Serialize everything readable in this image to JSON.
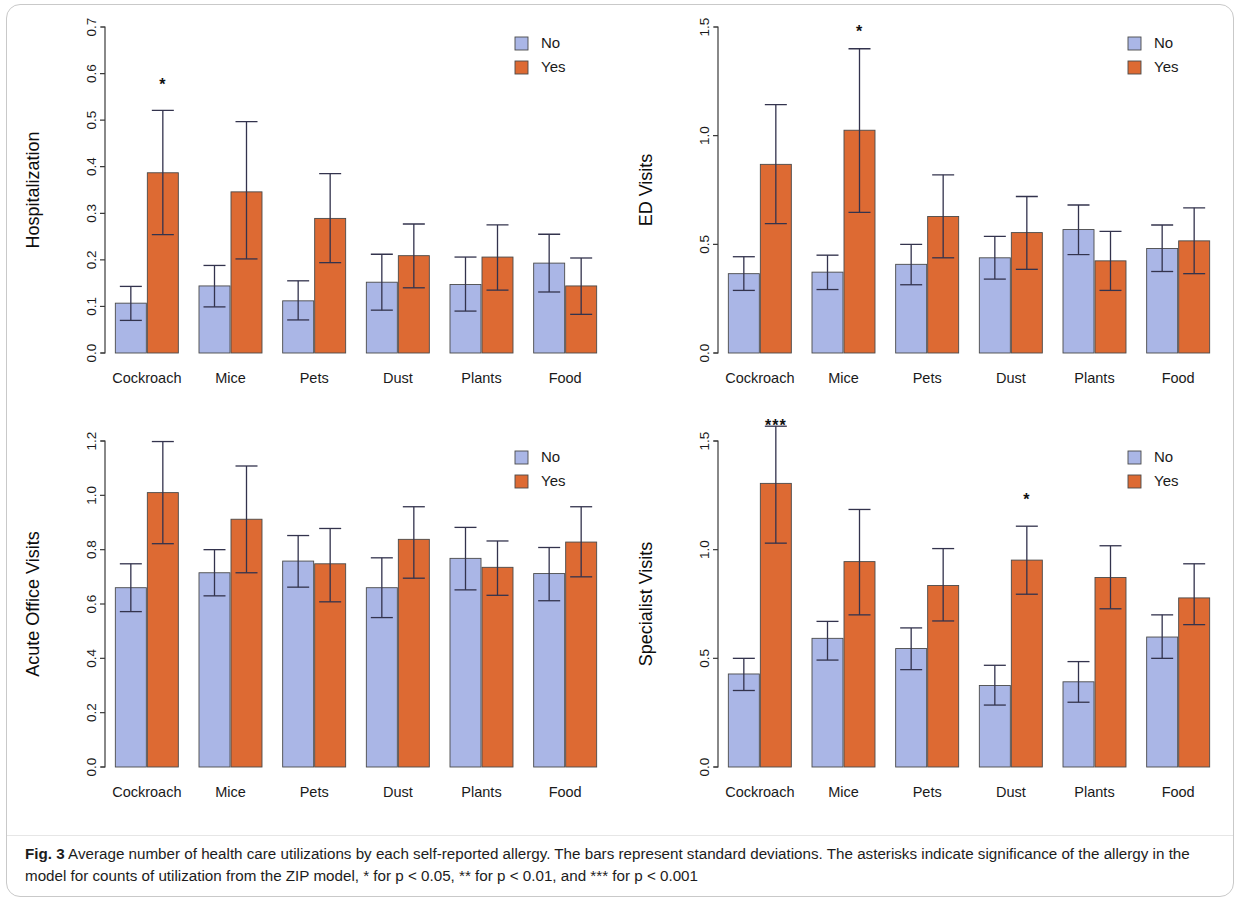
{
  "figure": {
    "label": "Fig. 3",
    "caption": "Average number of health care utilizations by each self-reported allergy. The bars represent standard deviations. The asterisks indicate significance of the allergy in the model for counts of utilization from the ZIP model, * for p < 0.05, ** for p < 0.01, and *** for p < 0.001"
  },
  "legend": {
    "position": "top-right",
    "entries": [
      {
        "label": "No",
        "color": "#aab6e6"
      },
      {
        "label": "Yes",
        "color": "#dd6a33"
      }
    ]
  },
  "colors": {
    "no": "#aab6e6",
    "yes": "#dd6a33",
    "bar_outline": "#4a4a4a",
    "error_bar": "#33334d",
    "axis": "#3a3a3a",
    "text": "#1a1a1a",
    "card_border": "#c9c9c9"
  },
  "chart_data": [
    {
      "type": "bar",
      "id": "hospitalization",
      "title": "",
      "xlabel": "",
      "ylabel": "Hospitalization",
      "ylim": [
        0,
        0.7
      ],
      "yticks": [
        0,
        0.1,
        0.2,
        0.3,
        0.4,
        0.5,
        0.6,
        0.7
      ],
      "ytick_labels": [
        "0.0",
        "0.1",
        "0.2",
        "0.3",
        "0.4",
        "0.5",
        "0.6",
        "0.7"
      ],
      "grid": false,
      "categories": [
        "Cockroach",
        "Mice",
        "Pets",
        "Dust",
        "Plants",
        "Food"
      ],
      "series": [
        {
          "name": "No",
          "color": "#aab6e6",
          "values": [
            0.107,
            0.144,
            0.112,
            0.152,
            0.147,
            0.193
          ],
          "err_low": [
            0.07,
            0.099,
            0.071,
            0.092,
            0.09,
            0.131
          ],
          "err_high": [
            0.143,
            0.188,
            0.155,
            0.212,
            0.206,
            0.255
          ]
        },
        {
          "name": "Yes",
          "color": "#dd6a33",
          "values": [
            0.387,
            0.346,
            0.289,
            0.209,
            0.206,
            0.144
          ],
          "err_low": [
            0.254,
            0.202,
            0.194,
            0.14,
            0.135,
            0.083
          ],
          "err_high": [
            0.521,
            0.497,
            0.385,
            0.277,
            0.275,
            0.204
          ]
        }
      ],
      "annotations": [
        {
          "category": "Cockroach",
          "series": "Yes",
          "text": "*",
          "y": 0.565
        }
      ]
    },
    {
      "type": "bar",
      "id": "ed_visits",
      "title": "",
      "xlabel": "",
      "ylabel": "ED Visits",
      "ylim": [
        0,
        1.5
      ],
      "yticks": [
        0,
        0.5,
        1.0,
        1.5
      ],
      "ytick_labels": [
        "0.0",
        "0.5",
        "1.0",
        "1.5"
      ],
      "grid": false,
      "categories": [
        "Cockroach",
        "Mice",
        "Pets",
        "Dust",
        "Plants",
        "Food"
      ],
      "series": [
        {
          "name": "No",
          "color": "#aab6e6",
          "values": [
            0.365,
            0.372,
            0.408,
            0.438,
            0.568,
            0.481
          ],
          "err_low": [
            0.288,
            0.292,
            0.314,
            0.34,
            0.453,
            0.375
          ],
          "err_high": [
            0.443,
            0.45,
            0.5,
            0.537,
            0.681,
            0.589
          ]
        },
        {
          "name": "Yes",
          "color": "#dd6a33",
          "values": [
            0.868,
            1.025,
            0.628,
            0.554,
            0.424,
            0.516
          ],
          "err_low": [
            0.595,
            0.647,
            0.438,
            0.385,
            0.288,
            0.365
          ],
          "err_high": [
            1.143,
            1.4,
            0.82,
            0.72,
            0.56,
            0.668
          ]
        }
      ],
      "annotations": [
        {
          "category": "Mice",
          "series": "Yes",
          "text": "*",
          "y": 1.455
        }
      ]
    },
    {
      "type": "bar",
      "id": "acute_office_visits",
      "title": "",
      "xlabel": "",
      "ylabel": "Acute Office Visits",
      "ylim": [
        0,
        1.2
      ],
      "yticks": [
        0,
        0.2,
        0.4,
        0.6,
        0.8,
        1.0,
        1.2
      ],
      "ytick_labels": [
        "0.0",
        "0.2",
        "0.4",
        "0.6",
        "0.8",
        "1.0",
        "1.2"
      ],
      "grid": false,
      "categories": [
        "Cockroach",
        "Mice",
        "Pets",
        "Dust",
        "Plants",
        "Food"
      ],
      "series": [
        {
          "name": "No",
          "color": "#aab6e6",
          "values": [
            0.66,
            0.715,
            0.758,
            0.66,
            0.768,
            0.712
          ],
          "err_low": [
            0.572,
            0.63,
            0.662,
            0.55,
            0.652,
            0.612
          ],
          "err_high": [
            0.748,
            0.8,
            0.852,
            0.77,
            0.882,
            0.808
          ]
        },
        {
          "name": "Yes",
          "color": "#dd6a33",
          "values": [
            1.01,
            0.912,
            0.748,
            0.838,
            0.735,
            0.828
          ],
          "err_low": [
            0.822,
            0.715,
            0.608,
            0.695,
            0.632,
            0.7
          ],
          "err_high": [
            1.198,
            1.108,
            0.878,
            0.958,
            0.832,
            0.958
          ]
        }
      ],
      "annotations": []
    },
    {
      "type": "bar",
      "id": "specialist_visits",
      "title": "",
      "xlabel": "",
      "ylabel": "Specialist Visits",
      "ylim": [
        0,
        1.5
      ],
      "yticks": [
        0,
        0.5,
        1.0,
        1.5
      ],
      "ytick_labels": [
        "0.0",
        "0.5",
        "1.0",
        "1.5"
      ],
      "grid": false,
      "categories": [
        "Cockroach",
        "Mice",
        "Pets",
        "Dust",
        "Plants",
        "Food"
      ],
      "series": [
        {
          "name": "No",
          "color": "#aab6e6",
          "values": [
            0.428,
            0.592,
            0.545,
            0.375,
            0.392,
            0.598
          ],
          "err_low": [
            0.352,
            0.492,
            0.448,
            0.285,
            0.298,
            0.5
          ],
          "err_high": [
            0.5,
            0.67,
            0.64,
            0.468,
            0.485,
            0.7
          ]
        },
        {
          "name": "Yes",
          "color": "#dd6a33",
          "values": [
            1.305,
            0.945,
            0.835,
            0.952,
            0.872,
            0.778
          ],
          "err_low": [
            1.03,
            0.7,
            0.672,
            0.795,
            0.728,
            0.655
          ],
          "err_high": [
            1.568,
            1.185,
            1.005,
            1.108,
            1.018,
            0.935
          ]
        }
      ],
      "annotations": [
        {
          "category": "Cockroach",
          "series": "Yes",
          "text": "***",
          "y": 1.7
        },
        {
          "category": "Dust",
          "series": "Yes",
          "text": "*",
          "y": 1.205
        }
      ]
    }
  ]
}
